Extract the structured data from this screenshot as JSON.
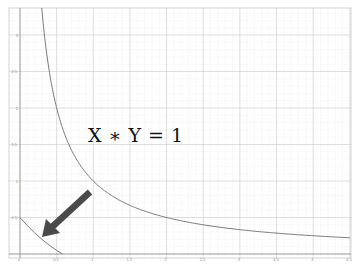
{
  "chart_data": {
    "type": "line",
    "title": "",
    "annotation": "X ∗ Y = 1",
    "xlabel": "",
    "ylabel": "",
    "xlim": [
      -0.15,
      4.5
    ],
    "ylim": [
      -0.05,
      3.35
    ],
    "x_ticks": [
      "0",
      "0.5",
      "1",
      "1.5",
      "2",
      "2.5",
      "3",
      "3.5",
      "4",
      "4.5"
    ],
    "y_ticks": [
      "0.5",
      "1",
      "1.5",
      "2",
      "2.5",
      "3"
    ],
    "grid": true,
    "minor_grid": true,
    "series": [
      {
        "name": "y = 1/x",
        "formula": "1/x",
        "x_range": [
          0.3,
          4.5
        ],
        "color": "#777777"
      },
      {
        "name": "lower curve",
        "points": [
          [
            0,
            0.5
          ],
          [
            0.1,
            0.39
          ],
          [
            0.2,
            0.29
          ],
          [
            0.3,
            0.2
          ],
          [
            0.4,
            0.12
          ],
          [
            0.5,
            0.05
          ],
          [
            0.58,
            0
          ]
        ],
        "color": "#777777"
      }
    ],
    "arrow": {
      "from": [
        1.0,
        0.85
      ],
      "to": [
        0.32,
        0.23
      ],
      "color": "#4a4a4a"
    }
  },
  "equation_label": "X ∗ Y = 1"
}
